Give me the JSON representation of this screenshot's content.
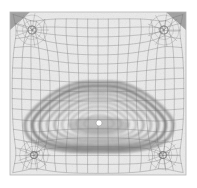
{
  "figure": {
    "title": "Adaptive quadrilateral mesh with nested contour bands",
    "type": "mesh-contour-plot",
    "canvas": {
      "width": 197,
      "height": 188,
      "background": "#ffffff"
    },
    "domain": {
      "name": "mesh-domain",
      "x": 10,
      "y": 12,
      "width": 176,
      "height": 163,
      "fill": "#ebebeb",
      "border_color": "#b4b4b4"
    },
    "mesh": {
      "name": "adaptive-quad-mesh",
      "line_color": "#6e6e6e",
      "line_width": 0.55,
      "nominal_cell_size": 9.5,
      "columns": 18,
      "rows": 17,
      "note": "Structured grid bowed toward the interior, refined near singular nodes"
    },
    "singular_nodes": [
      {
        "name": "singular-node-top-left",
        "cx": 32,
        "cy": 30,
        "r": 4.0
      },
      {
        "name": "singular-node-top-right",
        "cx": 164,
        "cy": 30,
        "r": 4.0
      },
      {
        "name": "singular-node-bottom-left",
        "cx": 34,
        "cy": 155,
        "r": 3.4
      },
      {
        "name": "singular-node-bottom-right",
        "cx": 163,
        "cy": 155,
        "r": 3.4
      }
    ],
    "corner_wedges": [
      {
        "name": "corner-wedge-top-left",
        "points": "10,12 30,12 10,30",
        "fill": "#6a6a6a"
      },
      {
        "name": "corner-wedge-top-right",
        "points": "186,12 166,12 186,30",
        "fill": "#6a6a6a"
      }
    ],
    "contour_blob": {
      "name": "contour-blob",
      "description": "Rounded-triangular nested level sets",
      "apex": {
        "x": 99,
        "y": 82
      },
      "center_marker": {
        "name": "center-marker",
        "cx": 99,
        "cy": 123,
        "r": 3.0,
        "fill": "#ffffff"
      },
      "bands": [
        {
          "level": 1,
          "color": "#8a8a8a",
          "opacity": 0.8,
          "stroke_width": 3.2,
          "scale": 1.0
        },
        {
          "level": 2,
          "color": "#6f6f6f",
          "opacity": 0.85,
          "stroke_width": 3.0,
          "scale": 0.9
        },
        {
          "level": 3,
          "color": "#7d7d7d",
          "opacity": 0.8,
          "stroke_width": 2.6,
          "scale": 0.8
        },
        {
          "level": 4,
          "color": "#9a9a9a",
          "opacity": 0.75,
          "stroke_width": 2.4,
          "scale": 0.7
        },
        {
          "level": 5,
          "color": "#8c8c8c",
          "opacity": 0.75,
          "stroke_width": 2.2,
          "scale": 0.6
        },
        {
          "level": 6,
          "color": "#a2a2a2",
          "opacity": 0.7,
          "stroke_width": 2.0,
          "scale": 0.5
        },
        {
          "level": 7,
          "color": "#9b9b9b",
          "opacity": 0.7,
          "stroke_width": 1.8,
          "scale": 0.4
        },
        {
          "level": 8,
          "color": "#adadad",
          "opacity": 0.65,
          "stroke_width": 1.6,
          "scale": 0.3
        },
        {
          "level": 9,
          "color": "#a6a6a6",
          "opacity": 0.6,
          "stroke_width": 1.4,
          "scale": 0.2
        }
      ]
    },
    "palette": {
      "background": "#ffffff",
      "domain_fill": "#ebebeb",
      "mesh_line": "#6e6e6e",
      "contour_dark": "#6f6f6f",
      "contour_light": "#adadad",
      "wedge": "#6a6a6a",
      "marker": "#ffffff"
    }
  }
}
